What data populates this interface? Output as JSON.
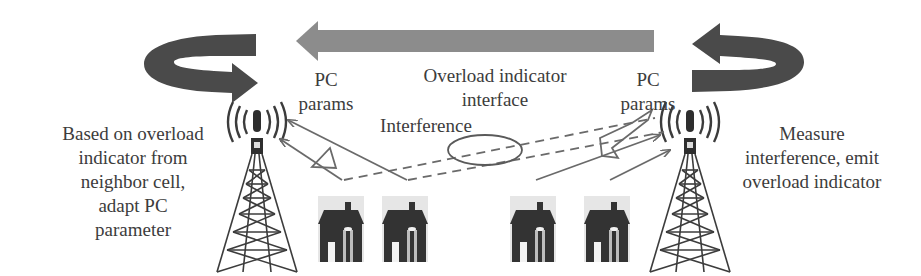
{
  "diagram": {
    "type": "network-diagram",
    "colors": {
      "curved_arrow": "#4a4a4a",
      "interface_arrow": "#8c8c8c",
      "tower": "#3c3c3c",
      "house": "#3a3a3a",
      "link_line": "#6a6a6a",
      "text": "#3c3c3c"
    },
    "left_cell": {
      "description_lines": [
        "Based on overload",
        "indicator from",
        "neighbor cell,",
        "adapt PC",
        "parameter"
      ],
      "pc_label_lines": [
        "PC",
        "params"
      ],
      "icons": [
        "curved-arrow-icon",
        "cell-tower-icon",
        "house-icon",
        "house-icon"
      ]
    },
    "interface": {
      "label_lines": [
        "Overload indicator",
        "interface"
      ],
      "direction": "right-to-left"
    },
    "interference": {
      "label": "Interference"
    },
    "right_cell": {
      "description_lines": [
        "Measure",
        "interference, emit",
        "overload indicator"
      ],
      "pc_label_lines": [
        "PC",
        "params"
      ],
      "icons": [
        "curved-arrow-icon",
        "cell-tower-icon",
        "house-icon",
        "house-icon"
      ]
    }
  }
}
